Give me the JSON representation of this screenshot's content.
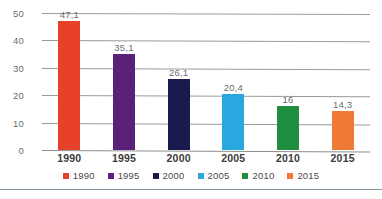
{
  "chart_data": {
    "type": "bar",
    "title": "",
    "subtitle": "",
    "xlabel": "",
    "ylabel": "",
    "categories": [
      "1990",
      "1995",
      "2000",
      "2005",
      "2010",
      "2015"
    ],
    "values": [
      47.1,
      35.1,
      26.1,
      20.4,
      16,
      14.3
    ],
    "value_labels": [
      "47,1",
      "35,1",
      "26,1",
      "20,4",
      "16",
      "14,3"
    ],
    "colors": [
      "#e8412a",
      "#5b2178",
      "#191a4e",
      "#29a8e0",
      "#1f8f3f",
      "#ee7a35"
    ],
    "ylim": [
      0,
      50
    ],
    "yticks": [
      0,
      10,
      20,
      30,
      40,
      50
    ],
    "ytick_labels": [
      "0",
      "10",
      "20",
      "30",
      "40",
      "50"
    ],
    "grid": true,
    "grid_axis": "y",
    "legend_position": "bottom",
    "legend": [
      {
        "label": "1990",
        "color": "#e8412a"
      },
      {
        "label": "1995",
        "color": "#5b2178"
      },
      {
        "label": "2000",
        "color": "#191a4e"
      },
      {
        "label": "2005",
        "color": "#29a8e0"
      },
      {
        "label": "2010",
        "color": "#1f8f3f"
      },
      {
        "label": "2015",
        "color": "#ee7a35"
      }
    ],
    "annotations": []
  },
  "style": {
    "grid_color": "#9a9a9a",
    "axis_color": "#8e8e8e",
    "tick_text_color": "#6d6d6d",
    "category_text_color": "#3b3b3b",
    "rule_color": "#7f95a6",
    "background": "#ffffff"
  }
}
